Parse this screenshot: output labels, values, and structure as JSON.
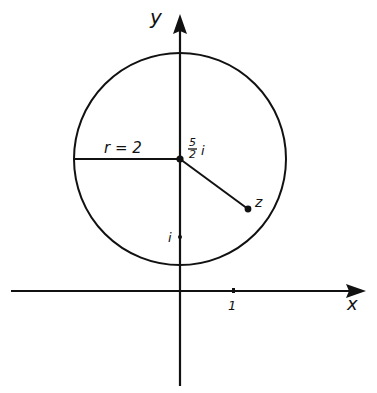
{
  "figure": {
    "type": "complex-plane-circle",
    "stroke_color": "#111111",
    "background": "#ffffff",
    "axes": {
      "x_label": "x",
      "y_label": "y",
      "tick_x_label": "1",
      "tick_i_label": "i"
    },
    "circle": {
      "center_label_num": "5",
      "center_label_den": "2",
      "center_label_suffix": "i",
      "radius_label": "r = 2"
    },
    "point_z_label": "z"
  }
}
